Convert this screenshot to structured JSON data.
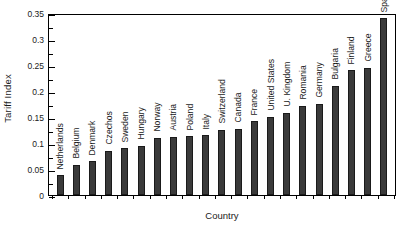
{
  "chart_data": {
    "type": "bar",
    "title": "",
    "xlabel": "Country",
    "ylabel": "Tariff Index",
    "ylim": [
      0,
      0.35
    ],
    "yticks": [
      "0",
      "0.05",
      "0.1",
      "0.15",
      "0.2",
      "0.25",
      "0.3",
      "0.35"
    ],
    "ytick_values": [
      0,
      0.05,
      0.1,
      0.15,
      0.2,
      0.25,
      0.3,
      0.35
    ],
    "minor_tick_step": 0.025,
    "grid": false,
    "legend": null,
    "bar_color": "#3a3a3a",
    "categories": [
      "Netherlands",
      "Belgium",
      "Denmark",
      "Czechos",
      "Sweden",
      "Hungary",
      "Norway",
      "Austria",
      "Poland",
      "Italy",
      "Switzerland",
      "Canada",
      "France",
      "United States",
      "U. Kingdom",
      "Romania",
      "Germany",
      "Bulgaria",
      "Finland",
      "Greece",
      "Spain"
    ],
    "values": [
      0.038,
      0.058,
      0.065,
      0.085,
      0.09,
      0.095,
      0.11,
      0.112,
      0.113,
      0.115,
      0.125,
      0.127,
      0.142,
      0.15,
      0.158,
      0.172,
      0.175,
      0.21,
      0.24,
      0.245,
      0.34
    ]
  }
}
